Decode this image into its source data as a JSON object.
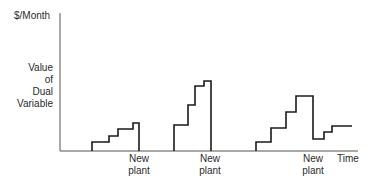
{
  "chart_data": {
    "type": "line",
    "title": "",
    "ylabel_top": "$/Month",
    "ylabel": "Value of Dual Variable",
    "ylabel_lines": [
      "Value",
      "of",
      "Dual",
      "Variable"
    ],
    "xlabel": "Time",
    "axis": {
      "origin_px": [
        60,
        151
      ],
      "x_end_px": 358,
      "y_top_px": 13
    },
    "grid": false,
    "legend": null,
    "annotations": [
      {
        "text": "New plant",
        "lines": [
          "New",
          "plant"
        ],
        "x_px": 139
      },
      {
        "text": "New plant",
        "lines": [
          "New",
          "plant"
        ],
        "x_px": 210
      },
      {
        "text": "New plant",
        "lines": [
          "New",
          "plant"
        ],
        "x_px": 313
      }
    ],
    "series": [
      {
        "name": "cycle-1",
        "description": "Step function rising in 4 steps then dropping at new plant",
        "points_px": [
          [
            92,
            151
          ],
          [
            92,
            142
          ],
          [
            109,
            142
          ],
          [
            109,
            136
          ],
          [
            118,
            136
          ],
          [
            118,
            129
          ],
          [
            133,
            129
          ],
          [
            133,
            123
          ],
          [
            139,
            123
          ],
          [
            139,
            151
          ]
        ]
      },
      {
        "name": "cycle-2",
        "description": "Step function rising in 4 steps (larger) then dropping at new plant",
        "points_px": [
          [
            174,
            151
          ],
          [
            174,
            125
          ],
          [
            188,
            125
          ],
          [
            188,
            105
          ],
          [
            195,
            105
          ],
          [
            195,
            86
          ],
          [
            204,
            86
          ],
          [
            204,
            81
          ],
          [
            211,
            81
          ],
          [
            211,
            151
          ]
        ]
      },
      {
        "name": "cycle-3",
        "description": "Step function rising in 4 steps, drops at new plant to a lower level then rises again",
        "points_px": [
          [
            256,
            151
          ],
          [
            256,
            142
          ],
          [
            271,
            142
          ],
          [
            271,
            128
          ],
          [
            286,
            128
          ],
          [
            286,
            112
          ],
          [
            296,
            112
          ],
          [
            296,
            96
          ],
          [
            313,
            96
          ],
          [
            313,
            139
          ],
          [
            324,
            139
          ],
          [
            324,
            132
          ],
          [
            332,
            132
          ],
          [
            332,
            126
          ],
          [
            352,
            126
          ]
        ]
      }
    ],
    "line_color": "#1a1a1a",
    "axis_color": "#555555"
  }
}
